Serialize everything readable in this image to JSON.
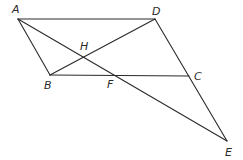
{
  "diagram": {
    "type": "geometry",
    "points": {
      "A": {
        "x": 18,
        "y": 19,
        "label": "A",
        "lx": 12,
        "ly": 13
      },
      "D": {
        "x": 155,
        "y": 19,
        "label": "D",
        "lx": 152,
        "ly": 15
      },
      "B": {
        "x": 50,
        "y": 75,
        "label": "B",
        "lx": 44,
        "ly": 89
      },
      "C": {
        "x": 189,
        "y": 76,
        "label": "C",
        "lx": 194,
        "ly": 80
      },
      "H": {
        "x": 84,
        "y": 57,
        "label": "H",
        "lx": 80,
        "ly": 50
      },
      "F": {
        "x": 113,
        "y": 75,
        "label": "F",
        "lx": 107,
        "ly": 88
      },
      "E": {
        "x": 227,
        "y": 141,
        "label": "E",
        "lx": 225,
        "ly": 156
      }
    },
    "segments": [
      [
        "A",
        "D"
      ],
      [
        "A",
        "B"
      ],
      [
        "B",
        "C"
      ],
      [
        "D",
        "E"
      ],
      [
        "B",
        "D"
      ],
      [
        "A",
        "E"
      ]
    ],
    "labels": [
      "A",
      "D",
      "H",
      "B",
      "F",
      "C",
      "E"
    ],
    "colors": {
      "line": "#2a2a2a",
      "background": "#ffffff"
    }
  }
}
